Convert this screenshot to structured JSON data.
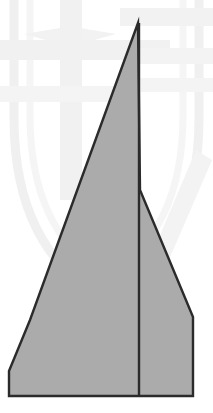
{
  "figure": {
    "canvas": {
      "width": 213,
      "height": 413,
      "background_color": "#ffffff"
    },
    "style": {
      "fill_color": "#ababab",
      "stroke_color": "#2b2b2b",
      "stroke_width": 2.4,
      "watermark_color": "#f1f1f1",
      "watermark_color_faint": "#f6f6f6",
      "watermark_opacity": 1
    },
    "shapes": {
      "body_outline": {
        "name": "airplane-body-polygon",
        "points": "138,23 30,320 9,371 9,396 193,396 193,317 178,281 140,190"
      },
      "center_fold_line": {
        "name": "center-fold-line",
        "x1": 139.0,
        "y1": 23,
        "x2": 139.0,
        "y2": 396
      }
    },
    "vertices": [
      {
        "label": "apex",
        "x": 138,
        "y": 23
      },
      {
        "label": "left-wing-bevel-start",
        "x": 30,
        "y": 320
      },
      {
        "label": "left-wing-tip",
        "x": 9,
        "y": 371
      },
      {
        "label": "left-trailing-corner",
        "x": 9,
        "y": 396
      },
      {
        "label": "right-trailing-corner",
        "x": 193,
        "y": 396
      },
      {
        "label": "right-bevel-lower",
        "x": 193,
        "y": 317
      },
      {
        "label": "right-bevel-upper",
        "x": 178,
        "y": 281
      },
      {
        "label": "fin-notch-vertex",
        "x": 140,
        "y": 190
      }
    ],
    "watermark": {
      "name": "shield-crest-watermark",
      "shield_path": "M 14 -30 L 199 -30 L 199 118 Q 199 250 106 300 Q 14 250 14 118 Z",
      "inner_shield_path": "M 30 -18 L 183 -18 L 183 115 Q 183 232 106 276 Q 30 232 30 115 Z",
      "cross_vertical": {
        "x": 60,
        "y": -30,
        "width": 22,
        "height": 230
      },
      "cross_horizontal": {
        "x": -10,
        "y": 40,
        "width": 180,
        "height": 20
      },
      "cross_horizontal_2": {
        "x": -10,
        "y": 86,
        "width": 150,
        "height": 16
      },
      "band_right_1": {
        "x": 120,
        "y": 8,
        "width": 110,
        "height": 18
      },
      "band_right_2": {
        "x": 130,
        "y": 48,
        "width": 95,
        "height": 16
      },
      "band_right_3": {
        "x": 140,
        "y": 78,
        "width": 80,
        "height": 14
      },
      "diag_band": "M 196 150 L 212 160 L 168 262 L 152 254 Z",
      "star_path": "M 70 -8 L 80 28 L 116 34 L 80 44 L 70 80 L 60 44 L 24 34 L 60 28 Z"
    }
  }
}
